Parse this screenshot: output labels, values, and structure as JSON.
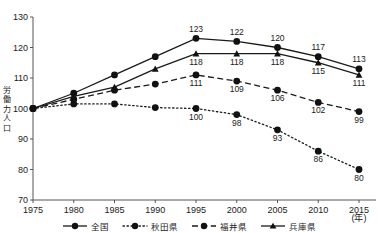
{
  "top_note": "",
  "axis": {
    "ylabel": "労働力人口",
    "ylabel_chars": [
      "労",
      "働",
      "力",
      "人",
      "口"
    ],
    "xunit": "(年)",
    "yticks": [
      "70",
      "80",
      "90",
      "100",
      "110",
      "120",
      "130"
    ],
    "xticks": [
      "1975",
      "1980",
      "1985",
      "1990",
      "1995",
      "2000",
      "2005",
      "2010",
      "2015"
    ]
  },
  "legend": {
    "items": [
      {
        "label": "全国",
        "style": "solid",
        "marker": "circle",
        "name": "zenkoku"
      },
      {
        "label": "秋田県",
        "style": "dotted",
        "marker": "circle",
        "name": "akita"
      },
      {
        "label": "福井県",
        "style": "dashed",
        "marker": "circle",
        "name": "fukui"
      },
      {
        "label": "兵庫県",
        "style": "solid",
        "marker": "triangle",
        "name": "hyogo"
      }
    ]
  },
  "chart_data": {
    "type": "line",
    "title": "",
    "xlabel": "(年)",
    "ylabel": "労働力人口",
    "xlim": [
      1975,
      2015
    ],
    "ylim": [
      70,
      130
    ],
    "ytick_step": 10,
    "grid": false,
    "legend_position": "bottom",
    "x": [
      1975,
      1980,
      1985,
      1990,
      1995,
      2000,
      2005,
      2010,
      2015
    ],
    "series": [
      {
        "name": "全国",
        "style": "solid",
        "marker": "circle",
        "values": [
          100,
          105,
          111,
          117,
          123,
          122,
          120,
          117,
          113
        ],
        "labels": [
          "",
          "",
          "",
          "",
          "123",
          "122",
          "120",
          "117",
          "113"
        ],
        "label_pos": [
          "",
          "",
          "",
          "",
          "above",
          "above",
          "above",
          "above",
          "above"
        ]
      },
      {
        "name": "兵庫県",
        "style": "solid",
        "marker": "triangle",
        "values": [
          100,
          104,
          107,
          113,
          118,
          118,
          118,
          115,
          111
        ],
        "labels": [
          "",
          "",
          "",
          "",
          "118",
          "118",
          "118",
          "115",
          "111"
        ],
        "label_pos": [
          "",
          "",
          "",
          "",
          "below",
          "below",
          "below",
          "below",
          "below"
        ]
      },
      {
        "name": "福井県",
        "style": "dashed",
        "marker": "circle",
        "values": [
          100,
          103,
          106,
          108,
          111,
          109,
          106,
          102,
          99
        ],
        "labels": [
          "",
          "",
          "",
          "",
          "111",
          "109",
          "106",
          "102",
          "99"
        ],
        "label_pos": [
          "",
          "",
          "",
          "",
          "below",
          "below",
          "below",
          "below",
          "below"
        ]
      },
      {
        "name": "秋田県",
        "style": "dotted",
        "marker": "circle",
        "values": [
          100,
          101.5,
          101.5,
          100.3,
          100,
          98,
          93,
          86,
          80
        ],
        "labels": [
          "",
          "",
          "",
          "",
          "100",
          "98",
          "93",
          "86",
          "80"
        ],
        "label_pos": [
          "",
          "",
          "",
          "",
          "below",
          "below",
          "below",
          "below",
          "below"
        ]
      }
    ]
  }
}
